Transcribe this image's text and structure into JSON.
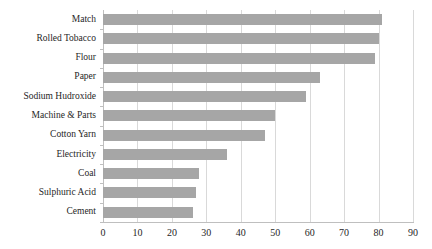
{
  "chart_data": {
    "type": "bar",
    "orientation": "horizontal",
    "title": "",
    "subtitle": "",
    "xlabel": "",
    "ylabel": "",
    "xlim": [
      0,
      90
    ],
    "xticks": [
      "0",
      "10",
      "20",
      "30",
      "40",
      "50",
      "60",
      "70",
      "80",
      "90"
    ],
    "grid": "vertical",
    "legend": "none",
    "bar_color": "#a6a6a6",
    "gridline_color": "#d9d9d9",
    "axis_color": "#bfbfbf",
    "text_color": "#262626",
    "categories": [
      "Match",
      "Rolled Tobacco",
      "Flour",
      "Paper",
      "Sodium Hudroxide",
      "Machine & Parts",
      "Cotton Yarn",
      "Electricity",
      "Coal",
      "Sulphuric Acid",
      "Cement"
    ],
    "values": [
      81,
      80,
      79,
      63,
      59,
      50,
      47,
      36,
      28,
      27,
      26
    ]
  }
}
